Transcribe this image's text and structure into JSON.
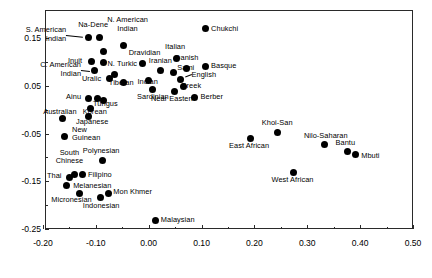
{
  "chart_data": {
    "type": "scatter",
    "title": "",
    "subtitle": "",
    "xlabel": "",
    "ylabel": "",
    "xlim": [
      -0.2,
      0.5
    ],
    "ylim": [
      -0.25,
      0.19
    ],
    "grid": false,
    "legend": "none",
    "xticks": [
      "-0.20",
      "-0.10",
      "0.00",
      "0.10",
      "0.20",
      "0.30",
      "0.40",
      "0.50"
    ],
    "xtick_values": [
      -0.2,
      -0.1,
      0.0,
      0.1,
      0.2,
      0.3,
      0.4,
      0.5
    ],
    "yticks": [
      "0.15",
      "0.05",
      "-0.05",
      "-0.15",
      "-0.25"
    ],
    "ytick_values": [
      0.15,
      0.05,
      -0.05,
      -0.15,
      -0.25
    ],
    "xtick_minor_values": [
      -0.15,
      -0.05,
      0.05,
      0.15,
      0.25,
      0.35,
      0.45
    ],
    "ytick_minor_values": [
      0.1,
      0.0,
      -0.1,
      -0.2
    ],
    "marker": "filled-circle",
    "marker_color": "#000000",
    "points": [
      {
        "label": "Chukchi",
        "x": 0.108,
        "y": 0.169,
        "lx": 0.118,
        "ly": 0.169,
        "align": "l"
      },
      {
        "label": "Na-Dene",
        "x": -0.093,
        "y": 0.151,
        "lx": -0.105,
        "ly": 0.176,
        "align": "c"
      },
      {
        "label": "N. American\nIndian",
        "x": -0.048,
        "y": 0.135,
        "lx": -0.04,
        "ly": 0.178,
        "align": "c"
      },
      {
        "label": "S. American\nIndian",
        "x": -0.114,
        "y": 0.152,
        "lx": -0.156,
        "ly": 0.157,
        "align": "r",
        "leader": true
      },
      {
        "label": "",
        "x": -0.085,
        "y": 0.122,
        "lx": 0,
        "ly": 0,
        "align": "c"
      },
      {
        "label": "Italian",
        "x": 0.052,
        "y": 0.107,
        "lx": 0.05,
        "ly": 0.13,
        "align": "c"
      },
      {
        "label": "Inuit",
        "x": -0.108,
        "y": 0.101,
        "lx": -0.126,
        "ly": 0.102,
        "align": "r"
      },
      {
        "label": "",
        "x": -0.085,
        "y": 0.099,
        "lx": 0,
        "ly": 0,
        "align": "c"
      },
      {
        "label": "Dravidian",
        "x": -0.012,
        "y": 0.096,
        "lx": -0.008,
        "ly": 0.118,
        "align": "c"
      },
      {
        "label": "Danish",
        "x": 0.072,
        "y": 0.086,
        "lx": 0.072,
        "ly": 0.107,
        "align": "c"
      },
      {
        "label": "Basque",
        "x": 0.108,
        "y": 0.09,
        "lx": 0.118,
        "ly": 0.09,
        "align": "l"
      },
      {
        "label": "Iranian",
        "x": 0.022,
        "y": 0.081,
        "lx": 0.022,
        "ly": 0.101,
        "align": "c"
      },
      {
        "label": "C. American\nIndian",
        "x": -0.102,
        "y": 0.081,
        "lx": -0.128,
        "ly": 0.084,
        "align": "r",
        "leader": true
      },
      {
        "label": "N. Turkic",
        "x": -0.064,
        "y": 0.073,
        "lx": -0.05,
        "ly": 0.094,
        "align": "c"
      },
      {
        "label": "Sami",
        "x": 0.047,
        "y": 0.078,
        "lx": 0.054,
        "ly": 0.087,
        "align": "l"
      },
      {
        "label": "English",
        "x": 0.06,
        "y": 0.063,
        "lx": 0.081,
        "ly": 0.072,
        "align": "l",
        "leader": true
      },
      {
        "label": "Uralic",
        "x": -0.074,
        "y": 0.066,
        "lx": -0.09,
        "ly": 0.064,
        "align": "r"
      },
      {
        "label": "Tibetan",
        "x": -0.048,
        "y": 0.057,
        "lx": -0.052,
        "ly": 0.055,
        "align": "c"
      },
      {
        "label": "Indian",
        "x": 0.0,
        "y": 0.061,
        "lx": -0.002,
        "ly": 0.057,
        "align": "c"
      },
      {
        "label": "Greek",
        "x": 0.066,
        "y": 0.048,
        "lx": 0.08,
        "ly": 0.048,
        "align": "c"
      },
      {
        "label": "Sardinian",
        "x": 0.008,
        "y": 0.043,
        "lx": 0.008,
        "ly": 0.026,
        "align": "c"
      },
      {
        "label": "Near Eastern",
        "x": 0.049,
        "y": 0.039,
        "lx": 0.046,
        "ly": 0.022,
        "align": "c"
      },
      {
        "label": "Berber",
        "x": 0.087,
        "y": 0.026,
        "lx": 0.098,
        "ly": 0.026,
        "align": "l"
      },
      {
        "label": "Ainu",
        "x": -0.113,
        "y": 0.024,
        "lx": -0.128,
        "ly": 0.025,
        "align": "r"
      },
      {
        "label": "",
        "x": -0.097,
        "y": 0.024,
        "lx": 0,
        "ly": 0,
        "align": "c"
      },
      {
        "label": "Tungus",
        "x": -0.085,
        "y": 0.019,
        "lx": -0.082,
        "ly": 0.012,
        "align": "c"
      },
      {
        "label": "Korean",
        "x": -0.11,
        "y": 0.002,
        "lx": -0.102,
        "ly": -0.006,
        "align": "c"
      },
      {
        "label": "Australian",
        "x": -0.163,
        "y": -0.019,
        "lx": -0.168,
        "ly": -0.006,
        "align": "c"
      },
      {
        "label": "Japanese",
        "x": -0.113,
        "y": -0.014,
        "lx": -0.107,
        "ly": -0.026,
        "align": "c"
      },
      {
        "label": "New\nGuinean",
        "x": -0.16,
        "y": -0.056,
        "lx": -0.145,
        "ly": -0.052,
        "align": "l"
      },
      {
        "label": "Khoi-San",
        "x": 0.243,
        "y": -0.048,
        "lx": 0.243,
        "ly": -0.029,
        "align": "c"
      },
      {
        "label": "East African",
        "x": 0.193,
        "y": -0.06,
        "lx": 0.19,
        "ly": -0.076,
        "align": "c"
      },
      {
        "label": "Nilo-Saharan",
        "x": 0.333,
        "y": -0.073,
        "lx": 0.335,
        "ly": -0.056,
        "align": "c"
      },
      {
        "label": "Bantu",
        "x": 0.376,
        "y": -0.087,
        "lx": 0.372,
        "ly": -0.071,
        "align": "c"
      },
      {
        "label": "Mbuti",
        "x": 0.391,
        "y": -0.095,
        "lx": 0.402,
        "ly": -0.097,
        "align": "l"
      },
      {
        "label": "Polynesian",
        "x": -0.088,
        "y": -0.106,
        "lx": -0.09,
        "ly": -0.088,
        "align": "c"
      },
      {
        "label": "South\nChinese",
        "x": -0.14,
        "y": -0.135,
        "lx": -0.15,
        "ly": -0.1,
        "align": "c"
      },
      {
        "label": "Thai",
        "x": -0.15,
        "y": -0.143,
        "lx": -0.165,
        "ly": -0.14,
        "align": "r"
      },
      {
        "label": "Filipino",
        "x": -0.126,
        "y": -0.136,
        "lx": -0.115,
        "ly": -0.137,
        "align": "l"
      },
      {
        "label": "Melanesian",
        "x": -0.155,
        "y": -0.159,
        "lx": -0.143,
        "ly": -0.16,
        "align": "l"
      },
      {
        "label": "Micronesian",
        "x": -0.131,
        "y": -0.175,
        "lx": -0.146,
        "ly": -0.19,
        "align": "c"
      },
      {
        "label": "Indonesian",
        "x": -0.092,
        "y": -0.184,
        "lx": -0.09,
        "ly": -0.202,
        "align": "c"
      },
      {
        "label": "Mon Khmer",
        "x": -0.077,
        "y": -0.175,
        "lx": -0.067,
        "ly": -0.174,
        "align": "l"
      },
      {
        "label": "West African",
        "x": 0.274,
        "y": -0.131,
        "lx": 0.272,
        "ly": -0.149,
        "align": "c"
      },
      {
        "label": "Malaysian",
        "x": 0.012,
        "y": -0.232,
        "lx": 0.023,
        "ly": -0.232,
        "align": "l"
      }
    ]
  },
  "figure": {
    "background_color": "#ffffff",
    "axis_color": "#2a2a2a",
    "marker_color": "#000000"
  }
}
